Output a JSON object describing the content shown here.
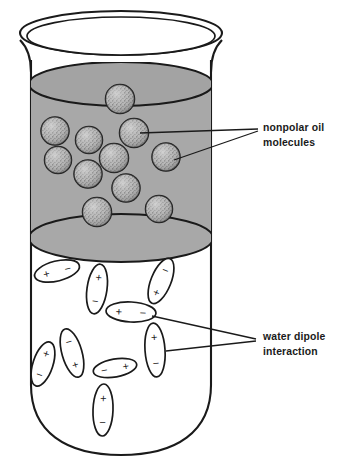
{
  "figure": {
    "background_color": "#ffffff",
    "stroke_color": "#1a1a1a"
  },
  "container": {
    "name": "beaker",
    "rim_label": "beaker-rim",
    "glass_color": "#ffffff",
    "outline_color": "#1a1a1a"
  },
  "oil_layer": {
    "fill_color": "#a8a8a8",
    "outline_color": "#1a1a1a",
    "top_y": 84,
    "bottom_y": 238
  },
  "water_layer": {
    "fill_color": "#ffffff"
  },
  "oil_molecules": {
    "count": 13,
    "fill_color": "#b4b4b4",
    "speckle_color": "#3c3c3c",
    "positions": [
      {
        "cx": 120,
        "cy": 99,
        "r": 14.5
      },
      {
        "cx": 55,
        "cy": 131,
        "r": 14.0
      },
      {
        "cx": 88,
        "cy": 140,
        "r": 13.5
      },
      {
        "cx": 134,
        "cy": 133,
        "r": 14.5
      },
      {
        "cx": 58,
        "cy": 159,
        "r": 13.5
      },
      {
        "cx": 114,
        "cy": 158,
        "r": 14.5
      },
      {
        "cx": 166,
        "cy": 157,
        "r": 14.0
      },
      {
        "cx": 88,
        "cy": 174,
        "r": 14.0
      },
      {
        "cx": 126,
        "cy": 188,
        "r": 14.0
      },
      {
        "cx": 97,
        "cy": 211,
        "r": 14.5
      },
      {
        "cx": 159,
        "cy": 209,
        "r": 13.5
      },
      {
        "cx": 70,
        "cy": 120,
        "r": 0
      },
      {
        "cx": 0,
        "cy": 0,
        "r": 0
      }
    ]
  },
  "water_dipoles": {
    "count": 15,
    "plus_symbol": "+",
    "minus_symbol": "−",
    "outline_color": "#1a1a1a",
    "items": [
      {
        "cx": 57,
        "cy": 271,
        "rx": 23,
        "ry": 10,
        "rot": -14,
        "plus_at": "start"
      },
      {
        "cx": 97,
        "cy": 289,
        "rx": 10,
        "ry": 25,
        "rot": 8,
        "plus_at": "start"
      },
      {
        "cx": 161,
        "cy": 281,
        "rx": 10,
        "ry": 24,
        "rot": 22,
        "plus_at": "end"
      },
      {
        "cx": 131,
        "cy": 312,
        "rx": 25,
        "ry": 10,
        "rot": 3,
        "plus_at": "start"
      },
      {
        "cx": 72,
        "cy": 353,
        "rx": 10,
        "ry": 25,
        "rot": -16,
        "plus_at": "start"
      },
      {
        "cx": 43,
        "cy": 364,
        "rx": 10,
        "ry": 23,
        "rot": 18,
        "plus_at": "start"
      },
      {
        "cx": 115,
        "cy": 368,
        "rx": 22,
        "ry": 9,
        "rot": -10,
        "plus_at": "end"
      },
      {
        "cx": 155,
        "cy": 350,
        "rx": 10,
        "ry": 27,
        "rot": -4,
        "plus_at": "start"
      },
      {
        "cx": 103,
        "cy": 410,
        "rx": 10,
        "ry": 26,
        "rot": 2,
        "plus_at": "start"
      }
    ]
  },
  "labels": {
    "oil": {
      "line1": "nonpolar oil",
      "line2": "molecules",
      "x": 263,
      "y1": 131,
      "y2": 146,
      "leader_targets": [
        {
          "x": 140,
          "y": 133
        },
        {
          "x": 174,
          "y": 160
        }
      ],
      "leader_anchor": {
        "x": 258,
        "y": 129
      }
    },
    "water": {
      "line1": "water dipole",
      "line2": "interaction",
      "x": 263,
      "y1": 340,
      "y2": 355,
      "leader_targets": [
        {
          "x": 152,
          "y": 316
        },
        {
          "x": 166,
          "y": 350
        }
      ],
      "leader_anchor": {
        "x": 256,
        "y": 339
      }
    }
  }
}
